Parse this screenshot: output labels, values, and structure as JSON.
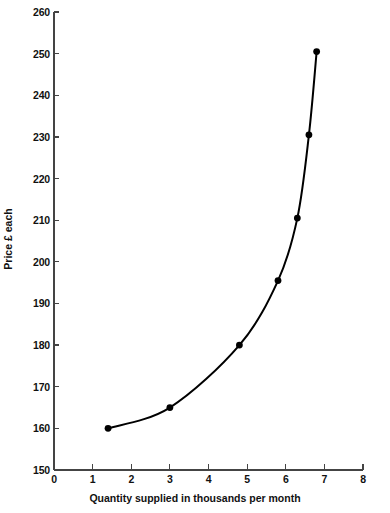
{
  "chart_data": {
    "type": "line",
    "title": "",
    "subtitle": "",
    "xlabel": "Quantity supplied in thousands per month",
    "ylabel": "Price £ each",
    "xlim": [
      0,
      8
    ],
    "ylim": [
      150,
      260
    ],
    "xticks": [
      0,
      1,
      2,
      3,
      4,
      5,
      6,
      7,
      8
    ],
    "xtick_labels": [
      "0",
      "1",
      "2",
      "3",
      "4",
      "5",
      "6",
      "7",
      "8"
    ],
    "yticks": [
      150,
      160,
      170,
      180,
      190,
      200,
      210,
      220,
      230,
      240,
      250,
      260
    ],
    "ytick_labels": [
      "150",
      "160",
      "170",
      "180",
      "190",
      "200",
      "210",
      "220",
      "230",
      "240",
      "250",
      "260"
    ],
    "grid": false,
    "legend": null,
    "legend_position": "none",
    "annotations": [],
    "series": [
      {
        "name": "Supply curve",
        "color": "#000000",
        "marker": "circle",
        "line_style": "solid",
        "x": [
          1.4,
          3.0,
          4.8,
          5.8,
          6.3,
          6.6,
          6.8
        ],
        "y": [
          160,
          165,
          180,
          195.5,
          210.5,
          230.5,
          250.5
        ]
      }
    ]
  },
  "axes": {
    "x_title": "Quantity supplied in thousands per month",
    "y_title": "Price £ each"
  },
  "colors": {
    "axis": "#444444",
    "curve": "#000000",
    "marker": "#000000",
    "background": "#ffffff",
    "text": "#111111"
  }
}
